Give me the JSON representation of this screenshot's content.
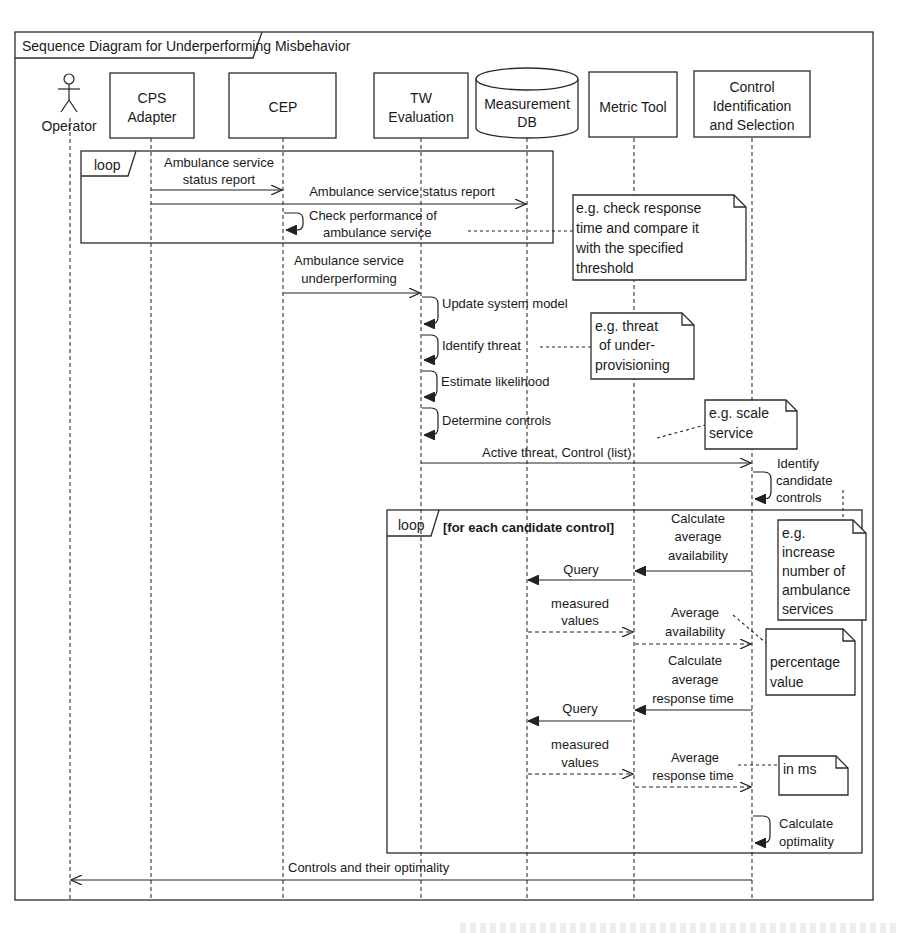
{
  "diagram": {
    "title": "Sequence Diagram for  Underperforming  Misbehavior",
    "participants": [
      {
        "id": "operator",
        "label": [
          "Operator"
        ],
        "type": "actor"
      },
      {
        "id": "cps",
        "label": [
          "CPS",
          "Adapter"
        ],
        "type": "box"
      },
      {
        "id": "cep",
        "label": [
          "CEP"
        ],
        "type": "box"
      },
      {
        "id": "tw",
        "label": [
          "TW",
          "Evaluation"
        ],
        "type": "box"
      },
      {
        "id": "db",
        "label": [
          "Measurement",
          "DB"
        ],
        "type": "database"
      },
      {
        "id": "metric",
        "label": [
          "Metric Tool"
        ],
        "type": "box"
      },
      {
        "id": "control",
        "label": [
          "Control",
          "Identification",
          "and Selection"
        ],
        "type": "box"
      }
    ],
    "fragments": [
      {
        "kind": "loop",
        "label": "loop",
        "guard": ""
      },
      {
        "kind": "loop",
        "label": "loop",
        "guard": "[for each candidate control]"
      }
    ],
    "messages": [
      {
        "from": "cps",
        "to": "cep",
        "label": [
          "Ambulance service",
          "status report"
        ],
        "style": "sync"
      },
      {
        "from": "cps",
        "to": "db",
        "label": [
          "Ambulance service status report"
        ],
        "style": "sync"
      },
      {
        "from": "cep",
        "to": "cep",
        "label": [
          "Check performance of",
          "ambulance service"
        ],
        "style": "self"
      },
      {
        "from": "cep",
        "to": "tw",
        "label": [
          "Ambulance service",
          "underperforming"
        ],
        "style": "sync"
      },
      {
        "from": "tw",
        "to": "tw",
        "label": [
          "Update system model"
        ],
        "style": "self"
      },
      {
        "from": "tw",
        "to": "tw",
        "label": [
          "Identify threat"
        ],
        "style": "self"
      },
      {
        "from": "tw",
        "to": "tw",
        "label": [
          "Estimate likelihood"
        ],
        "style": "self"
      },
      {
        "from": "tw",
        "to": "tw",
        "label": [
          "Determine controls"
        ],
        "style": "self"
      },
      {
        "from": "tw",
        "to": "control",
        "label": [
          "Active threat, Control (list)"
        ],
        "style": "sync"
      },
      {
        "from": "control",
        "to": "control",
        "label": [
          "Identify",
          "candidate",
          "controls"
        ],
        "style": "self"
      },
      {
        "from": "control",
        "to": "metric",
        "label": [
          "Calculate",
          "average",
          "availability"
        ],
        "style": "call"
      },
      {
        "from": "metric",
        "to": "db",
        "label": [
          "Query"
        ],
        "style": "call"
      },
      {
        "from": "db",
        "to": "metric",
        "label": [
          "measured",
          "values"
        ],
        "style": "return"
      },
      {
        "from": "metric",
        "to": "control",
        "label": [
          "Average",
          "availability"
        ],
        "style": "return"
      },
      {
        "from": "control",
        "to": "metric",
        "label": [
          "Calculate",
          "average",
          "response time"
        ],
        "style": "call"
      },
      {
        "from": "metric",
        "to": "db",
        "label": [
          "Query"
        ],
        "style": "call"
      },
      {
        "from": "db",
        "to": "metric",
        "label": [
          "measured",
          "values"
        ],
        "style": "return"
      },
      {
        "from": "metric",
        "to": "control",
        "label": [
          "Average",
          "response time"
        ],
        "style": "return"
      },
      {
        "from": "control",
        "to": "control",
        "label": [
          "Calculate",
          "optimality"
        ],
        "style": "self"
      },
      {
        "from": "control",
        "to": "operator",
        "label": [
          "Controls and their optimality"
        ],
        "style": "sync"
      }
    ],
    "notes": [
      {
        "text": [
          "e.g. check response",
          "time and compare it",
          "with the specified",
          "threshold"
        ]
      },
      {
        "text": [
          "e.g. threat",
          "of under-",
          "provisioning"
        ]
      },
      {
        "text": [
          "e.g. scale",
          "service"
        ]
      },
      {
        "text": [
          "e.g.",
          "increase",
          "number of",
          "ambulance",
          "services"
        ]
      },
      {
        "text": [
          "percentage",
          "value"
        ]
      },
      {
        "text": [
          "in ms"
        ]
      }
    ]
  }
}
